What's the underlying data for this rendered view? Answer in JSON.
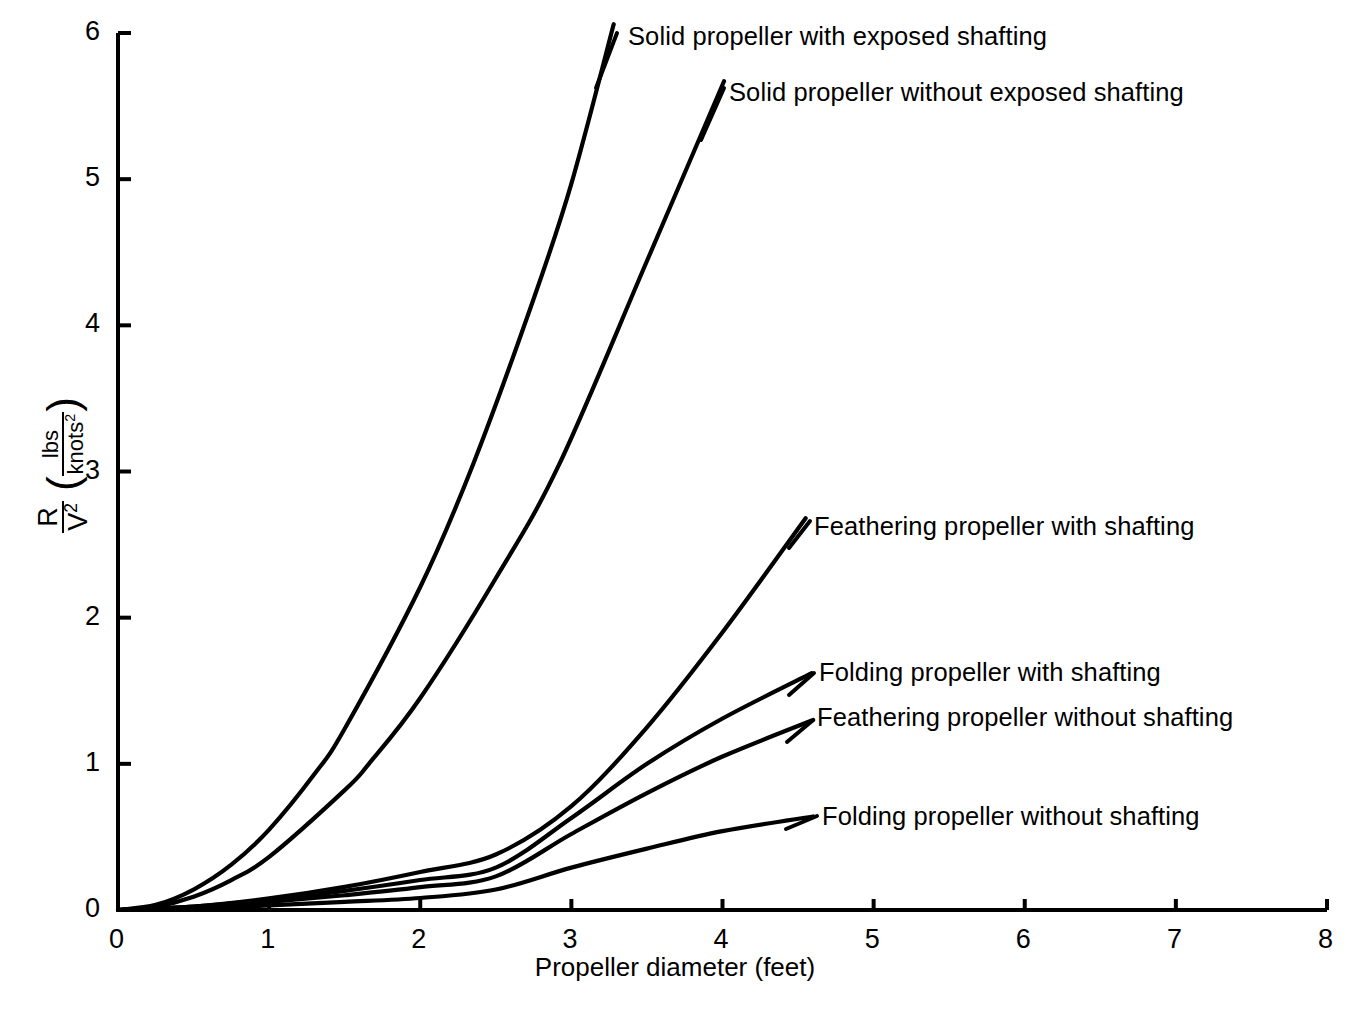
{
  "chart_data": {
    "type": "line",
    "title": "",
    "xlabel": "Propeller diameter (feet)",
    "ylabel_main": "R",
    "ylabel_main_den": "V",
    "ylabel_main_den_sup": "2",
    "ylabel_unit_num": "lbs",
    "ylabel_unit_den": "knots",
    "ylabel_unit_den_sup": "2",
    "ylabel_full": "R/V2 ( lbs/knots2 )",
    "xlim": [
      0,
      8
    ],
    "ylim": [
      0,
      6
    ],
    "xticks": [
      "0",
      "1",
      "2",
      "3",
      "4",
      "5",
      "6",
      "7",
      "8"
    ],
    "yticks": [
      "0",
      "1",
      "2",
      "3",
      "4",
      "5",
      "6"
    ],
    "grid": false,
    "legend_position": "inline-labels",
    "line_color": "#000000",
    "background_color": "#ffffff",
    "series": [
      {
        "name": "Solid propeller with exposed shafting",
        "label": "Solid propeller with exposed shafting",
        "coefficient": 0.552,
        "exponent": 2.06,
        "x_end": 3.28,
        "y_end": 6.06,
        "x": [
          0,
          0.25,
          0.5,
          0.75,
          1.0,
          1.3,
          1.5,
          2.0,
          2.35,
          2.75,
          3.0,
          3.28
        ],
        "y": [
          0,
          0.035,
          0.14,
          0.31,
          0.55,
          0.93,
          1.24,
          2.21,
          3.05,
          4.18,
          4.97,
          6.06
        ]
      },
      {
        "name": "Solid propeller without exposed shafting",
        "label": "Solid propeller without exposed shafting",
        "coefficient": 0.363,
        "exponent": 1.97,
        "x_end": 4.01,
        "y_end": 5.67,
        "x": [
          0,
          0.25,
          0.5,
          0.75,
          1.0,
          1.5,
          1.66,
          2.0,
          2.5,
          2.92,
          3.5,
          4.01
        ],
        "y": [
          0,
          0.023,
          0.091,
          0.205,
          0.363,
          0.82,
          1.0,
          1.45,
          2.27,
          3.05,
          4.44,
          5.67
        ]
      },
      {
        "name": "Feathering propeller with shafting",
        "label": "Feathering propeller with shafting",
        "coefficient": 0.079,
        "exponent": 1.72,
        "x_end": 4.55,
        "y_end": 2.68,
        "x": [
          0,
          0.5,
          1.0,
          1.5,
          2.0,
          2.5,
          3.0,
          3.5,
          4.0,
          4.55
        ],
        "y": [
          0,
          0.024,
          0.079,
          0.158,
          0.26,
          0.38,
          0.71,
          1.25,
          1.9,
          2.68
        ]
      },
      {
        "name": "Folding propeller with shafting",
        "label": "Folding propeller with shafting",
        "coefficient": 0.07,
        "exponent": 1.55,
        "x_end": 4.59,
        "y_end": 1.62,
        "x": [
          0,
          0.5,
          1.0,
          1.5,
          2.0,
          2.5,
          3.0,
          3.5,
          4.0,
          4.59
        ],
        "y": [
          0,
          0.024,
          0.07,
          0.131,
          0.205,
          0.29,
          0.63,
          1.0,
          1.31,
          1.62
        ]
      },
      {
        "name": "Feathering propeller without shafting",
        "label": "Feathering propeller without shafting",
        "coefficient": 0.055,
        "exponent": 1.5,
        "x_end": 4.6,
        "y_end": 1.3,
        "x": [
          0,
          0.5,
          1.0,
          1.5,
          2.0,
          2.5,
          3.0,
          3.5,
          4.0,
          4.6
        ],
        "y": [
          0,
          0.019,
          0.055,
          0.101,
          0.156,
          0.23,
          0.52,
          0.8,
          1.05,
          1.3
        ]
      },
      {
        "name": "Folding propeller without shafting",
        "label": "Folding propeller without shafting",
        "coefficient": 0.031,
        "exponent": 1.4,
        "x_end": 4.6,
        "y_end": 0.64,
        "x": [
          0,
          0.5,
          1.0,
          1.5,
          2.0,
          2.5,
          3.0,
          3.5,
          4.0,
          4.6
        ],
        "y": [
          0,
          0.012,
          0.031,
          0.055,
          0.082,
          0.14,
          0.29,
          0.42,
          0.54,
          0.64
        ]
      }
    ]
  }
}
